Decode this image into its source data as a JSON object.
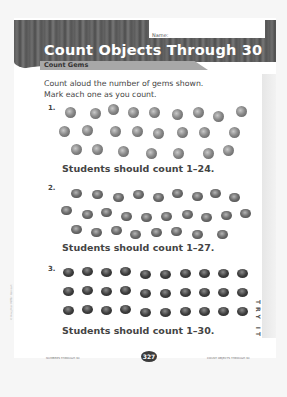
{
  "header": {
    "title": "Count Objects Through 30",
    "subtitle": "Count Gems",
    "name_label": "Name:"
  },
  "instructions": {
    "line1": "Count aloud the number of gems shown.",
    "line2": "Mark each one as you count."
  },
  "problems": [
    {
      "number": "1.",
      "gem_count": 24,
      "rows": [
        9,
        8,
        7
      ],
      "answer": "Students should count 1–24."
    },
    {
      "number": "2.",
      "gem_count": 27,
      "rows": [
        9,
        10,
        8
      ],
      "answer": "Students should count 1–27."
    },
    {
      "number": "3.",
      "gem_count": 30,
      "rows": [
        10,
        10,
        10
      ],
      "answer": "Students should count 1–30."
    }
  ],
  "footer": {
    "left": "NUMBERS THROUGH 30",
    "page_number": "327",
    "right": "COUNT OBJECTS THROUGH 30"
  },
  "side_tab": "TRY IT",
  "copyright": "© Houghton Mifflin Harcourt"
}
